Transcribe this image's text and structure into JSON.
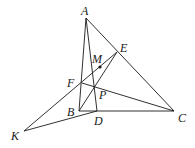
{
  "diagram": {
    "type": "geometry",
    "points": {
      "A": {
        "label": "A",
        "x": 86,
        "y": 18
      },
      "E": {
        "label": "E",
        "x": 117,
        "y": 52
      },
      "M": {
        "label": "M",
        "x": 100,
        "y": 67
      },
      "F": {
        "label": "F",
        "x": 82,
        "y": 83
      },
      "P": {
        "label": "P",
        "x": 96,
        "y": 87
      },
      "B": {
        "label": "B",
        "x": 79,
        "y": 111
      },
      "D": {
        "label": "D",
        "x": 97,
        "y": 111
      },
      "C": {
        "label": "C",
        "x": 174,
        "y": 111
      },
      "K": {
        "label": "K",
        "x": 24,
        "y": 131
      }
    },
    "segments": [
      "AB",
      "AD",
      "AC",
      "BC",
      "BE",
      "KE",
      "FC",
      "KD"
    ],
    "marked_points": [
      "M"
    ]
  }
}
